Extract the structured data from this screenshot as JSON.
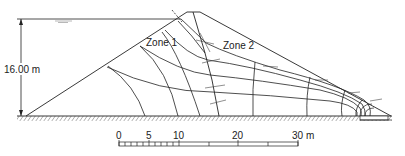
{
  "diagram": {
    "type": "flow-net",
    "labels": {
      "height": "16.00 m",
      "zone1": "Zone 1",
      "zone2": "Zone 2"
    },
    "scale_bar": {
      "ticks": [
        "0",
        "5",
        "10",
        "20",
        "30 m"
      ],
      "unit": "m"
    },
    "colors": {
      "line": "#222222",
      "background": "#ffffff"
    }
  }
}
